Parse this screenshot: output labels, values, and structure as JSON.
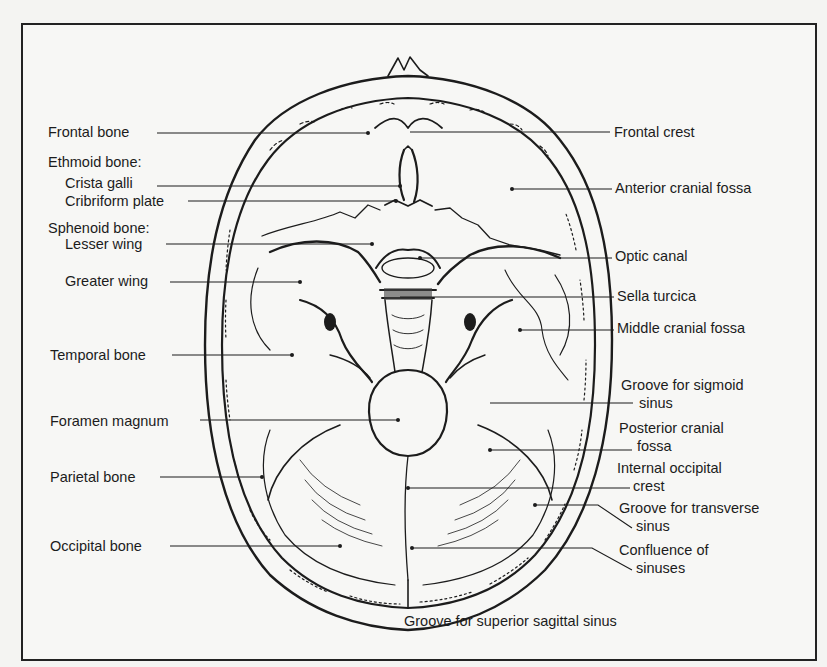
{
  "figure": {
    "labels_left": [
      {
        "id": "frontal-bone",
        "text": "Frontal bone",
        "x": 48,
        "y": 124
      },
      {
        "id": "ethmoid-bone-heading",
        "text": "Ethmoid bone:",
        "x": 48,
        "y": 154
      },
      {
        "id": "crista-galli",
        "text": "Crista galli",
        "x": 65,
        "y": 175
      },
      {
        "id": "cribriform-plate",
        "text": "Cribriform plate",
        "x": 65,
        "y": 193
      },
      {
        "id": "sphenoid-bone-heading",
        "text": "Sphenoid bone:",
        "x": 48,
        "y": 220
      },
      {
        "id": "lesser-wing",
        "text": "Lesser wing",
        "x": 65,
        "y": 236
      },
      {
        "id": "greater-wing",
        "text": "Greater wing",
        "x": 65,
        "y": 273
      },
      {
        "id": "temporal-bone",
        "text": "Temporal bone",
        "x": 50,
        "y": 347
      },
      {
        "id": "foramen-magnum",
        "text": "Foramen magnum",
        "x": 50,
        "y": 413
      },
      {
        "id": "parietal-bone",
        "text": "Parietal bone",
        "x": 50,
        "y": 469
      },
      {
        "id": "occipital-bone",
        "text": "Occipital bone",
        "x": 50,
        "y": 538
      }
    ],
    "labels_right": [
      {
        "id": "frontal-crest",
        "text": "Frontal crest",
        "x": 614,
        "y": 124
      },
      {
        "id": "anterior-cranial-fossa",
        "text": "Anterior cranial fossa",
        "x": 615,
        "y": 180
      },
      {
        "id": "optic-canal",
        "text": "Optic canal",
        "x": 615,
        "y": 248
      },
      {
        "id": "sella-turcica",
        "text": "Sella turcica",
        "x": 617,
        "y": 288
      },
      {
        "id": "middle-cranial-fossa",
        "text": "Middle cranial fossa",
        "x": 617,
        "y": 320
      },
      {
        "id": "groove-sigmoid-l1",
        "text": "Groove for sigmoid",
        "x": 621,
        "y": 377
      },
      {
        "id": "groove-sigmoid-l2",
        "text": "sinus",
        "x": 639,
        "y": 397
      },
      {
        "id": "posterior-cranial-fossa-l1",
        "text": "Posterior cranial",
        "x": 619,
        "y": 420
      },
      {
        "id": "posterior-cranial-fossa-l2",
        "text": "fossa",
        "x": 637,
        "y": 440
      },
      {
        "id": "internal-occipital-crest-l1",
        "text": "Internal occipital",
        "x": 617,
        "y": 460
      },
      {
        "id": "internal-occipital-crest-l2",
        "text": "crest",
        "x": 633,
        "y": 480
      },
      {
        "id": "groove-transverse-l1",
        "text": "Groove for transverse",
        "x": 619,
        "y": 500
      },
      {
        "id": "groove-transverse-l2",
        "text": "sinus",
        "x": 636,
        "y": 520
      },
      {
        "id": "confluence-l1",
        "text": "Confluence of",
        "x": 619,
        "y": 542
      },
      {
        "id": "confluence-l2",
        "text": "sinuses",
        "x": 636,
        "y": 562
      }
    ],
    "labels_bottom": [
      {
        "id": "groove-superior-sagittal",
        "text": "Groove for superior sagittal sinus",
        "x": 404,
        "y": 613
      }
    ],
    "colors": {
      "ink": "#1c1c1c",
      "paper": "#f7f7f5",
      "background": "#f4f4f2"
    }
  }
}
